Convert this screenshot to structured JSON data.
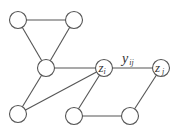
{
  "diagram": {
    "type": "undirected-graph",
    "colors": {
      "stroke": "#555555",
      "fill": "#ffffff",
      "text": "#333333"
    },
    "node_radius": 8.5,
    "nodes": [
      {
        "id": "n1",
        "x": 18,
        "y": 20,
        "label": ""
      },
      {
        "id": "n2",
        "x": 74,
        "y": 20,
        "label": ""
      },
      {
        "id": "n3",
        "x": 46,
        "y": 68,
        "label": ""
      },
      {
        "id": "zi",
        "x": 104,
        "y": 68,
        "label": "z",
        "sub": "i"
      },
      {
        "id": "zj",
        "x": 161,
        "y": 68,
        "label": "z",
        "sub": "j"
      },
      {
        "id": "n4",
        "x": 18,
        "y": 114,
        "label": ""
      },
      {
        "id": "n5",
        "x": 74,
        "y": 116,
        "label": ""
      },
      {
        "id": "n6",
        "x": 130,
        "y": 116,
        "label": ""
      }
    ],
    "edges": [
      {
        "from": "n1",
        "to": "n2"
      },
      {
        "from": "n1",
        "to": "n3"
      },
      {
        "from": "n2",
        "to": "n3"
      },
      {
        "from": "n3",
        "to": "zi"
      },
      {
        "from": "n3",
        "to": "n4"
      },
      {
        "from": "n4",
        "to": "zi"
      },
      {
        "from": "zi",
        "to": "n5"
      },
      {
        "from": "zi",
        "to": "zj",
        "label": "y",
        "sub": "ij"
      },
      {
        "from": "n5",
        "to": "n6"
      },
      {
        "from": "n6",
        "to": "zj"
      }
    ],
    "edge_label": {
      "main": "y",
      "sub": "ij"
    },
    "node_zi": {
      "main": "z",
      "sub": "i"
    },
    "node_zj": {
      "main": "z",
      "sub": "j"
    }
  }
}
